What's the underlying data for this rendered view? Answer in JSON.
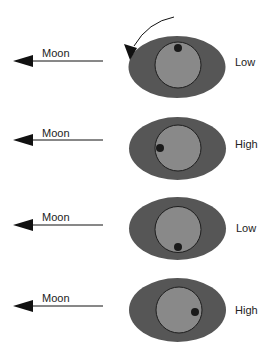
{
  "diagram": {
    "title": "",
    "colors": {
      "ocean": "#565656",
      "earth": "#898989",
      "earth_outline": "#1e1e1e",
      "observer": "#1a1a1a",
      "arrow": "#111111",
      "text": "#222222"
    },
    "rotation_arrow": {
      "icon": "curved-arrow-counterclockwise"
    },
    "rows": [
      {
        "arrow_label": "Moon",
        "tide_label": "Low",
        "observer_position": "top"
      },
      {
        "arrow_label": "Moon",
        "tide_label": "High",
        "observer_position": "left"
      },
      {
        "arrow_label": "Moon",
        "tide_label": "Low",
        "observer_position": "bottom"
      },
      {
        "arrow_label": "Moon",
        "tide_label": "High",
        "observer_position": "right"
      }
    ]
  }
}
